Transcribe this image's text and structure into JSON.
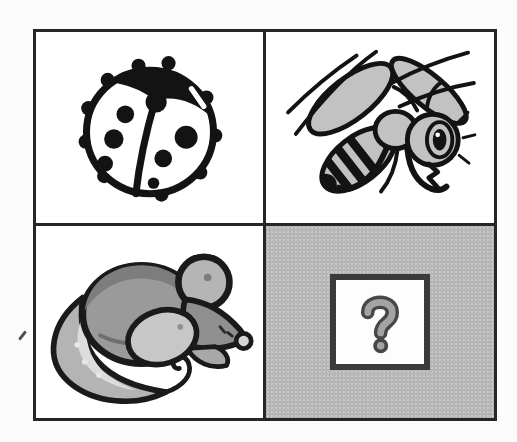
{
  "page": {
    "kind": "scanned picture-matrix puzzle",
    "background_color": "#fcfcfc"
  },
  "palette": {
    "grid_border": "#262626",
    "ink_black": "#131313",
    "clipart_gray": "#c2c2c2",
    "mouse_body_gray": "#9a9a9a",
    "mouse_dark_gray": "#7d7d7d",
    "mouse_light_gray": "#c7c7c7",
    "placeholder_cell_bg": "#b7b7b7",
    "answer_box_bg": "#fdfdfd",
    "answer_box_border": "#3a3a3a",
    "question_fill": "#a3a3a3",
    "question_outline": "#474747"
  },
  "puzzle": {
    "layout": "2x2 grid",
    "cells": [
      {
        "position": "top-left",
        "content": "ladybug",
        "kind": "illustration",
        "background": "#ffffff"
      },
      {
        "position": "top-right",
        "content": "bee",
        "kind": "illustration",
        "background": "#ffffff"
      },
      {
        "position": "bottom-left",
        "content": "mouse",
        "kind": "illustration",
        "background": "#ffffff"
      },
      {
        "position": "bottom-right",
        "content": "missing item placeholder",
        "kind": "placeholder",
        "symbol": "?",
        "background": "#b7b7b7"
      }
    ]
  },
  "artifacts": {
    "stray_mark": "small pen tick in left margin outside grid"
  }
}
